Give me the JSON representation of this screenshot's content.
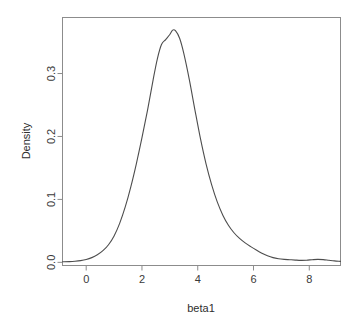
{
  "chart_data": {
    "type": "line",
    "title": "",
    "subtitle": "",
    "xlabel": "beta1",
    "ylabel": "Density",
    "xlim": [
      -0.85,
      9.12
    ],
    "ylim": [
      -0.005,
      0.389
    ],
    "xticks": [
      0,
      2,
      4,
      6,
      8
    ],
    "xtick_labels": [
      "0",
      "2",
      "4",
      "6",
      "8"
    ],
    "yticks": [
      0.0,
      0.1,
      0.2,
      0.3
    ],
    "ytick_labels": [
      "0.0",
      "0.1",
      "0.2",
      "0.3"
    ],
    "grid": false,
    "legend": false,
    "legend_position": "none",
    "line_color": "#4d4d4d",
    "line_width": 1.1,
    "box_color": "#8c8c8c",
    "background": "#ffffff",
    "annotations": [],
    "series": [
      {
        "name": "Density",
        "x": [
          -0.85,
          -0.6,
          -0.4,
          -0.2,
          0.0,
          0.2,
          0.4,
          0.6,
          0.8,
          1.0,
          1.2,
          1.4,
          1.6,
          1.8,
          2.0,
          2.2,
          2.4,
          2.55,
          2.7,
          2.85,
          3.0,
          3.1,
          3.2,
          3.35,
          3.5,
          3.7,
          3.9,
          4.1,
          4.3,
          4.5,
          4.7,
          4.9,
          5.1,
          5.3,
          5.5,
          5.7,
          5.9,
          6.1,
          6.3,
          6.5,
          6.7,
          6.9,
          7.1,
          7.3,
          7.5,
          7.7,
          7.9,
          8.1,
          8.3,
          8.5,
          8.7,
          8.9,
          9.12
        ],
        "y": [
          0.001,
          0.0012,
          0.0018,
          0.0028,
          0.0045,
          0.0075,
          0.012,
          0.0185,
          0.028,
          0.042,
          0.062,
          0.088,
          0.12,
          0.157,
          0.198,
          0.242,
          0.29,
          0.323,
          0.346,
          0.354,
          0.362,
          0.369,
          0.368,
          0.356,
          0.332,
          0.29,
          0.242,
          0.196,
          0.156,
          0.123,
          0.096,
          0.075,
          0.059,
          0.047,
          0.038,
          0.031,
          0.025,
          0.0195,
          0.0145,
          0.0105,
          0.0075,
          0.0058,
          0.0048,
          0.0042,
          0.0036,
          0.0032,
          0.0034,
          0.0042,
          0.0048,
          0.0044,
          0.0034,
          0.0024,
          0.0016
        ]
      }
    ]
  }
}
